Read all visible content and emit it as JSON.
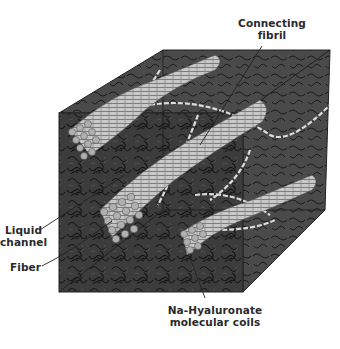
{
  "diagram": {
    "labels": {
      "connecting_fibril": [
        "Connecting",
        "fibril"
      ],
      "liquid_channel": [
        "Liquid",
        "channel"
      ],
      "fiber": "Fiber",
      "na_hyaluronate": [
        "Na-Hyaluronate",
        "molecular coils"
      ]
    },
    "colors": {
      "cube_front": "#3a3a3a",
      "cube_top": "#4a4a4a",
      "cube_side": "#444444",
      "coil_lines": "#111111",
      "fiber_fill": "#bdbdbd",
      "fibril": "#d8d8d8",
      "label_text": "#2a2a2a"
    }
  }
}
